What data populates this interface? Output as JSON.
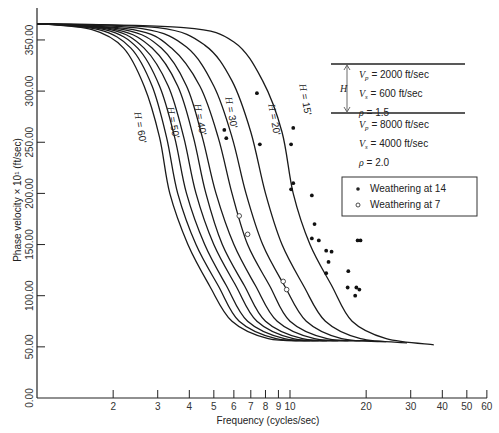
{
  "chart_data": {
    "type": "line",
    "title": "",
    "xlabel": "Frequency (cycles/sec)",
    "ylabel": "Phase velocity × 10¹ (ft/sec)",
    "xscale": "log",
    "xlim": [
      1,
      60
    ],
    "ylim": [
      0,
      370
    ],
    "x_ticks": [
      2,
      3,
      4,
      5,
      6,
      7,
      8,
      9,
      10,
      20,
      30,
      40,
      50,
      60
    ],
    "y_ticks": [
      "0.00",
      "50.00",
      "100.00",
      "150.00",
      "200.00",
      "250.00",
      "300.00",
      "350.00"
    ],
    "grid": false,
    "series": [
      {
        "name": "H = 15'",
        "label": "H = 15'",
        "points": [
          [
            1,
            366
          ],
          [
            3.8,
            362
          ],
          [
            6,
            348
          ],
          [
            7.8,
            310
          ],
          [
            9.3,
            260
          ],
          [
            10.3,
            200
          ],
          [
            12,
            150
          ],
          [
            14.6,
            110
          ],
          [
            17.6,
            75
          ],
          [
            24,
            58
          ],
          [
            37,
            52
          ]
        ]
      },
      {
        "name": "H = 20'",
        "label": "H = 20'",
        "points": [
          [
            1,
            366
          ],
          [
            3,
            362
          ],
          [
            4.6,
            345
          ],
          [
            5.9,
            310
          ],
          [
            7,
            260
          ],
          [
            8,
            200
          ],
          [
            9.3,
            150
          ],
          [
            11.3,
            110
          ],
          [
            13.8,
            75
          ],
          [
            19,
            58
          ],
          [
            29,
            54
          ]
        ]
      },
      {
        "name": "H = 25'",
        "label": "",
        "points": [
          [
            1,
            366
          ],
          [
            2.6,
            361
          ],
          [
            3.9,
            343
          ],
          [
            5,
            305
          ],
          [
            5.9,
            255
          ],
          [
            6.7,
            200
          ],
          [
            7.8,
            150
          ],
          [
            9.5,
            110
          ],
          [
            11.6,
            75
          ],
          [
            16,
            58
          ],
          [
            24,
            55
          ]
        ]
      },
      {
        "name": "H = 30'",
        "label": "H = 30'",
        "points": [
          [
            1,
            366
          ],
          [
            2.4,
            360
          ],
          [
            3.4,
            342
          ],
          [
            4.4,
            305
          ],
          [
            5.2,
            255
          ],
          [
            5.9,
            200
          ],
          [
            6.8,
            150
          ],
          [
            8.3,
            110
          ],
          [
            10,
            75
          ],
          [
            14,
            58
          ],
          [
            21,
            56
          ]
        ]
      },
      {
        "name": "H = 35'",
        "label": "",
        "points": [
          [
            1,
            366
          ],
          [
            2.2,
            360
          ],
          [
            3.1,
            342
          ],
          [
            3.9,
            305
          ],
          [
            4.5,
            255
          ],
          [
            5.1,
            200
          ],
          [
            6,
            150
          ],
          [
            7.3,
            110
          ],
          [
            8.9,
            75
          ],
          [
            12.5,
            58
          ],
          [
            19,
            56
          ]
        ]
      },
      {
        "name": "H = 40'",
        "label": "H = 40'",
        "points": [
          [
            1,
            366
          ],
          [
            2.05,
            360
          ],
          [
            2.85,
            342
          ],
          [
            3.6,
            305
          ],
          [
            4.15,
            255
          ],
          [
            4.65,
            200
          ],
          [
            5.4,
            150
          ],
          [
            6.6,
            110
          ],
          [
            8,
            75
          ],
          [
            11.2,
            58
          ],
          [
            17,
            56
          ]
        ]
      },
      {
        "name": "H = 45'",
        "label": "",
        "points": [
          [
            1,
            366
          ],
          [
            1.95,
            360
          ],
          [
            2.65,
            342
          ],
          [
            3.3,
            305
          ],
          [
            3.8,
            255
          ],
          [
            4.25,
            200
          ],
          [
            5,
            150
          ],
          [
            6.1,
            110
          ],
          [
            7.4,
            75
          ],
          [
            10.3,
            58
          ],
          [
            15.5,
            56
          ]
        ]
      },
      {
        "name": "H = 50'",
        "label": "H = 50'",
        "points": [
          [
            1,
            366
          ],
          [
            1.85,
            360
          ],
          [
            2.5,
            342
          ],
          [
            3.05,
            305
          ],
          [
            3.5,
            255
          ],
          [
            3.9,
            200
          ],
          [
            4.6,
            150
          ],
          [
            5.6,
            110
          ],
          [
            6.8,
            75
          ],
          [
            9.5,
            58
          ],
          [
            14,
            56
          ]
        ]
      },
      {
        "name": "H = 55'",
        "label": "",
        "points": [
          [
            1,
            366
          ],
          [
            1.75,
            360
          ],
          [
            2.35,
            342
          ],
          [
            2.85,
            305
          ],
          [
            3.25,
            255
          ],
          [
            3.6,
            200
          ],
          [
            4.25,
            150
          ],
          [
            5.2,
            110
          ],
          [
            6.3,
            75
          ],
          [
            8.8,
            58
          ],
          [
            13,
            56
          ]
        ]
      },
      {
        "name": "H = 60'",
        "label": "H = 60'",
        "points": [
          [
            1,
            366
          ],
          [
            1.65,
            360
          ],
          [
            2.2,
            342
          ],
          [
            2.65,
            305
          ],
          [
            3.05,
            255
          ],
          [
            3.35,
            200
          ],
          [
            3.95,
            150
          ],
          [
            4.8,
            110
          ],
          [
            5.9,
            75
          ],
          [
            8.2,
            58
          ],
          [
            12,
            56
          ]
        ]
      }
    ],
    "scatter": [
      {
        "name": "Weathering at 14",
        "marker": "filled",
        "points": [
          [
            7.4,
            298
          ],
          [
            5.5,
            262
          ],
          [
            5.6,
            254
          ],
          [
            7.6,
            248
          ],
          [
            10.3,
            264
          ],
          [
            10.1,
            248
          ],
          [
            10.3,
            210
          ],
          [
            10.1,
            204
          ],
          [
            12.2,
            198
          ],
          [
            12.5,
            170
          ],
          [
            12.2,
            156
          ],
          [
            13,
            154
          ],
          [
            13.9,
            144
          ],
          [
            14.6,
            143
          ],
          [
            14.2,
            133
          ],
          [
            13.9,
            122
          ],
          [
            17,
            124
          ],
          [
            18.5,
            154
          ],
          [
            19,
            154
          ],
          [
            16.9,
            108
          ],
          [
            18.3,
            108
          ],
          [
            18.8,
            106
          ],
          [
            18.1,
            100
          ]
        ]
      },
      {
        "name": "Weathering at 7",
        "marker": "open",
        "points": [
          [
            6.3,
            178
          ],
          [
            6.8,
            160
          ],
          [
            9.4,
            114
          ],
          [
            9.7,
            106
          ]
        ]
      }
    ],
    "legend": {
      "position": "right",
      "entries": [
        "Weathering at 14",
        "Weathering at 7"
      ]
    },
    "annotations": {
      "model_diagram": {
        "layer_label": "H",
        "upper_layer": [
          "Vp = 2000 ft/sec",
          "Vs = 600 ft/sec",
          "ρ = 1.5"
        ],
        "half_space": [
          "Vp = 8000 ft/sec",
          "Vs = 4000 ft/sec",
          "ρ = 2.0"
        ]
      }
    }
  },
  "text": {
    "xlabel": "Frequency (cycles/sec)",
    "ylabel": "Phase velocity × 10¹ (ft/sec)",
    "layer_h": "H",
    "upper": [
      {
        "sym": "V",
        "sub": "p",
        "rest": " = 2000 ft/sec"
      },
      {
        "sym": "V",
        "sub": "s",
        "rest": " = 600 ft/sec"
      },
      {
        "sym": "ρ",
        "sub": "",
        "rest": " = 1.5"
      }
    ],
    "lower": [
      {
        "sym": "V",
        "sub": "p",
        "rest": " = 8000 ft/sec"
      },
      {
        "sym": "V",
        "sub": "s",
        "rest": " = 4000 ft/sec"
      },
      {
        "sym": "ρ",
        "sub": "",
        "rest": " = 2.0"
      }
    ],
    "legend_filled": "Weathering at 14",
    "legend_open": "Weathering at 7"
  }
}
